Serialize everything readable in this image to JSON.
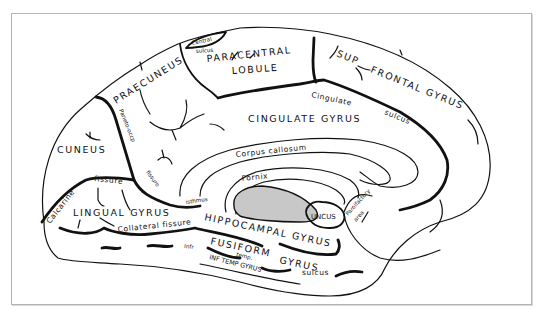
{
  "figure": {
    "colors": {
      "line": "#111111",
      "shaded_region": "#c8c8c8",
      "frame": "#b4b4b4",
      "background": "#ffffff"
    }
  },
  "labels": {
    "central_sulcus_1": "Central",
    "central_sulcus_2": "sulcus",
    "paracentral": "PARACENTRAL",
    "lobule": "LOBULE",
    "praecuneus": "PRAECUNEUS",
    "parieto_occ": "Parieto-occp",
    "fissure_po": "fissure",
    "sup": "SUP",
    "frontal_gyrus": "FRONTAL GYRUS",
    "cingulate": "Cingulate",
    "sulcus_cing": "sulcus",
    "cingulate_gyrus": "CINGULATE GYRUS",
    "corpus_callosum": "Corpus callosum",
    "fornix": "Fornix",
    "cuneus": "CUNEUS",
    "calcarine": "Calcarine",
    "fissure_calc": "fissure",
    "lingual_gyrus": "LINGUAL GYRUS",
    "isthmus": "isthmus",
    "hippocampal_gyrus": "HIPPOCAMPAL GYRUS",
    "uncus": "UNCUS",
    "parolfactory": "Parolfactory",
    "area": "area",
    "collateral_fissure": "Collateral fissure",
    "fusiform": "FUSIFORM",
    "gyrus_fus": "GYRUS",
    "infr": "Infr",
    "temp": "temp.",
    "sulcus_temp": "sulcus",
    "inf_temp_gyrus": "INF TEMP GYRUS"
  }
}
